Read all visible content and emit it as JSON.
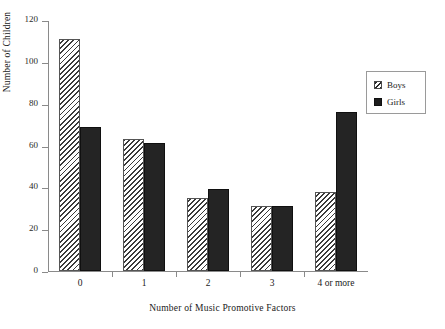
{
  "chart_data": {
    "type": "bar",
    "title": "",
    "subtitle": "",
    "xlabel": "Number of Music Promotive Factors",
    "ylabel": "Number of Children",
    "categories": [
      "0",
      "1",
      "2",
      "3",
      "4 or more"
    ],
    "series": [
      {
        "name": "Boys",
        "values": [
          111,
          63,
          35,
          31,
          38
        ],
        "fill": "diagonal-hatch",
        "color": "#3a3a3a"
      },
      {
        "name": "Girls",
        "values": [
          69,
          61,
          39,
          31,
          76
        ],
        "fill": "solid",
        "color": "#242424"
      }
    ],
    "ylim": [
      0,
      120
    ],
    "yticks": [
      0,
      20,
      40,
      60,
      80,
      100,
      120
    ],
    "ytick_labels": [
      "0",
      "20",
      "40",
      "60",
      "80",
      "100",
      "120"
    ],
    "grid": false,
    "legend_position": "upper-right",
    "legend_entries": [
      "Boys",
      "Girls"
    ]
  },
  "axis": {
    "y_title": "Number of Children",
    "x_title": "Number of Music Promotive Factors"
  },
  "legend": {
    "items": [
      {
        "label": "Boys"
      },
      {
        "label": "Girls"
      }
    ]
  }
}
